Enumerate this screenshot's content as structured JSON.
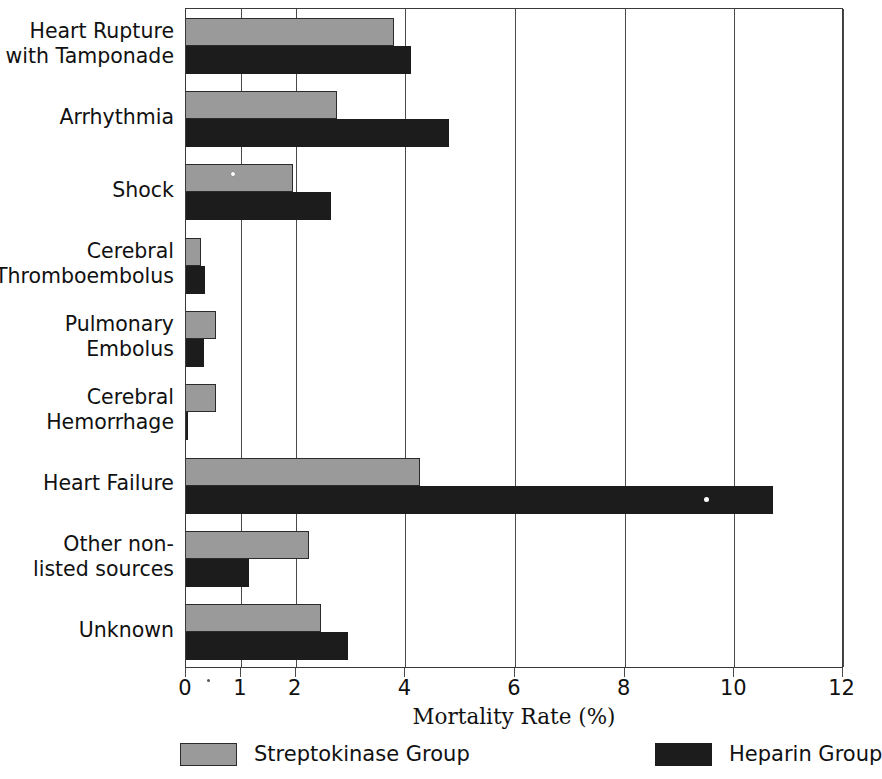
{
  "chart_data": {
    "type": "bar",
    "orientation": "horizontal",
    "title": "",
    "xlabel": "Mortality Rate (%)",
    "ylabel": "",
    "xlim": [
      0,
      12
    ],
    "xticks": [
      0,
      1,
      2,
      4,
      6,
      8,
      10,
      12
    ],
    "xtick_labels": [
      "0",
      "1",
      "2",
      "4",
      "6",
      "8",
      "10",
      "12"
    ],
    "grid": true,
    "grid_axis": "x",
    "legend_position": "bottom",
    "categories": [
      "Heart Rupture\nwith Tamponade",
      "Arrhythmia",
      "Shock",
      "Cerebral\nThromboembolus",
      "Pulmonary\nEmbolus",
      "Cerebral\nHemorrhage",
      "Heart Failure",
      "Other non-\nlisted sources",
      "Unknown"
    ],
    "series": [
      {
        "name": "Streptokinase Group",
        "color": "#9a9a9a",
        "values": [
          3.8,
          2.75,
          1.95,
          0.28,
          0.55,
          0.55,
          4.27,
          2.25,
          2.47
        ]
      },
      {
        "name": "Heparin Group",
        "color": "#1c1c1c",
        "values": [
          4.1,
          4.8,
          2.65,
          0.35,
          0.32,
          0.02,
          10.7,
          1.15,
          2.95
        ]
      }
    ]
  },
  "legend": {
    "entries": [
      {
        "label": "Streptokinase Group",
        "color": "#9a9a9a"
      },
      {
        "label": "Heparin Group",
        "color": "#1c1c1c"
      }
    ]
  },
  "axis": {
    "x_title": "Mortality Rate (%)"
  }
}
